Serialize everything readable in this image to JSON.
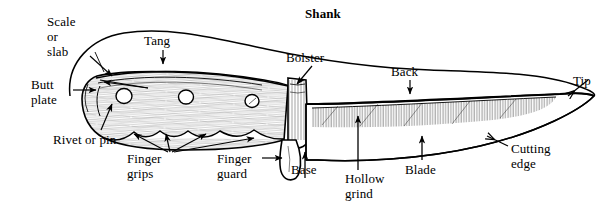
{
  "figure": {
    "background_color": "#ffffff",
    "ink_color": "#000000"
  },
  "labels": {
    "shank": "Shank",
    "scale_or_slab": "Scale\nor\nslab",
    "tang": "Tang",
    "bolster": "Bolster",
    "back": "Back",
    "tip": "Tip",
    "butt_plate": "Butt\nplate",
    "rivet_or_pin": "Rivet or pin",
    "finger_grips": "Finger\ngrips",
    "finger_guard": "Finger\nguard",
    "base": "Base",
    "hollow_grind": "Hollow\ngrind",
    "blade": "Blade",
    "cutting_edge": "Cutting\nedge"
  }
}
